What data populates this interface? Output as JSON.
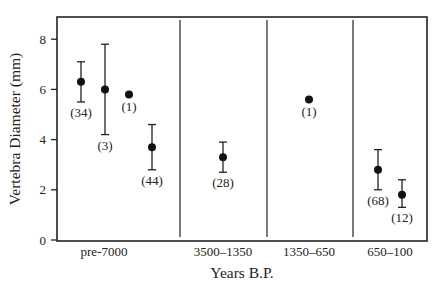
{
  "chart_data": {
    "type": "scatter",
    "title": "",
    "xlabel": "Years B.P.",
    "ylabel": "Vertebra Diameter (mm)",
    "ylim": [
      0,
      8.8
    ],
    "yticks": [
      0,
      2,
      4,
      6,
      8
    ],
    "ytick_labels": [
      "0",
      "2",
      "4",
      "6",
      "8"
    ],
    "grid": false,
    "categories": [
      "pre-7000",
      "3500–1350",
      "1350–650",
      "650–100"
    ],
    "points": [
      {
        "category": "pre-7000",
        "slot": 0,
        "value": 6.3,
        "low": 5.5,
        "high": 7.1,
        "n_label": "(34)"
      },
      {
        "category": "pre-7000",
        "slot": 1,
        "value": 6.0,
        "low": 4.2,
        "high": 7.8,
        "n_label": "(3)"
      },
      {
        "category": "pre-7000",
        "slot": 2,
        "value": 5.8,
        "low": null,
        "high": null,
        "n_label": "(1)"
      },
      {
        "category": "pre-7000",
        "slot": 3,
        "value": 3.7,
        "low": 2.8,
        "high": 4.6,
        "n_label": "(44)"
      },
      {
        "category": "3500–1350",
        "slot": 0,
        "value": 3.3,
        "low": 2.7,
        "high": 3.9,
        "n_label": "(28)"
      },
      {
        "category": "1350–650",
        "slot": 0,
        "value": 5.6,
        "low": null,
        "high": null,
        "n_label": "(1)"
      },
      {
        "category": "650–100",
        "slot": 0,
        "value": 2.8,
        "low": 2.0,
        "high": 3.6,
        "n_label": "(68)"
      },
      {
        "category": "650–100",
        "slot": 1,
        "value": 1.8,
        "low": 1.3,
        "high": 2.4,
        "n_label": "(12)"
      }
    ]
  }
}
